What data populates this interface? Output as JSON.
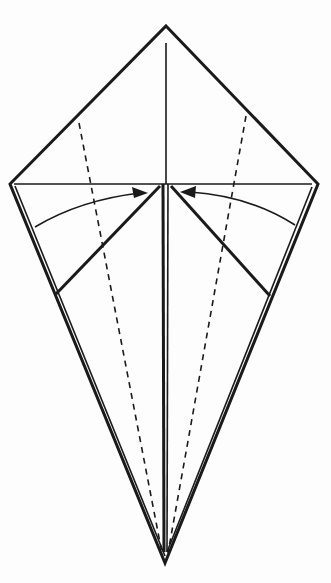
{
  "diagram": {
    "type": "origami-fold-diagram",
    "title": "",
    "shape": "kite base",
    "colors": {
      "line": "#1a1a1a",
      "background": "#fdfdfd"
    },
    "points": {
      "top_apex": [
        166,
        26
      ],
      "left_corner": [
        10,
        184
      ],
      "right_corner": [
        318,
        184
      ],
      "bottom_apex": [
        165,
        563
      ]
    },
    "annotations": [
      {
        "kind": "valley-fold-dashed",
        "side": "left"
      },
      {
        "kind": "valley-fold-dashed",
        "side": "right"
      },
      {
        "kind": "fold-arrow",
        "side": "left",
        "direction": "to-center"
      },
      {
        "kind": "fold-arrow",
        "side": "right",
        "direction": "to-center"
      }
    ]
  }
}
